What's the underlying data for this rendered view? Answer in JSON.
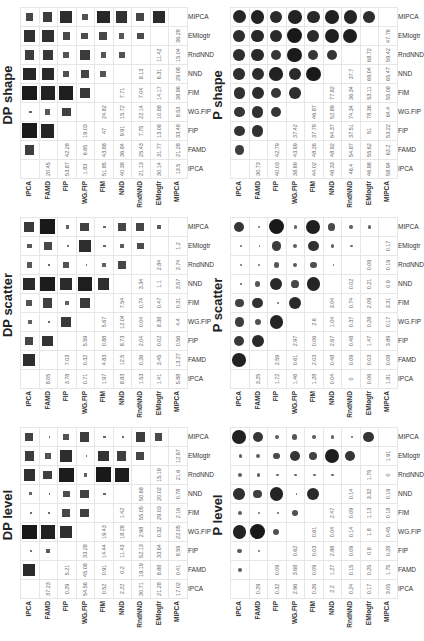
{
  "labels": [
    "IPCA",
    "FAMD",
    "FIP",
    "WG.FIP",
    "FIM",
    "NND",
    "RndNND",
    "EMlogtr",
    "MIPCA"
  ],
  "colors": {
    "marker": "#3c3c3c",
    "grid": "#e6e6e6",
    "text": "#666666"
  },
  "chart_data": [
    {
      "type": "heatmap",
      "title": "DP shape",
      "marker": "square",
      "lower_triangle_values": [
        [],
        [
          20.45
        ],
        [
          53.87,
          42.28
        ],
        [
          1.83,
          6.65,
          19.03
        ],
        [
          51.85,
          43.88,
          47,
          24.82
        ],
        [
          40.38,
          36.84,
          9.91,
          15.72,
          7.71
        ],
        [
          21.13,
          25.43,
          7.75,
          22.14,
          7.04,
          8.13
        ],
        [
          30.14,
          31.77,
          13.08,
          10.88,
          14.17,
          6.31,
          11.42
        ],
        [
          13.5,
          21.28,
          33.48,
          8.53,
          38.96,
          29.08,
          15.04,
          36.29
        ]
      ]
    },
    {
      "type": "heatmap",
      "title": "DP scatter",
      "marker": "square",
      "lower_triangle_values": [
        [],
        [
          8.05
        ],
        [
          3.78,
          7.03
        ],
        [
          0.71,
          0.32,
          5.59
        ],
        [
          1.97,
          4.83,
          0.88,
          5.67
        ],
        [
          8.83,
          12.5,
          8.73,
          12.04,
          7.54
        ],
        [
          1.53,
          0.26,
          2.04,
          0.04,
          0.74,
          3.34
        ],
        [
          1.41,
          3.45,
          0.02,
          8.38,
          0.47,
          1.1,
          2.84
        ],
        [
          5.88,
          13.27,
          0.56,
          4.4,
          0.31,
          3.57,
          3.74,
          1.2
        ]
      ]
    },
    {
      "type": "heatmap",
      "title": "DP level",
      "marker": "square",
      "lower_triangle_values": [
        [],
        [
          37.23
        ],
        [
          0.29,
          5.21
        ],
        [
          54.56,
          45.08,
          33.28
        ],
        [
          0.52,
          0.91,
          14.44,
          19.43
        ],
        [
          2.22,
          0.2,
          11.43,
          18.28,
          1.42
        ],
        [
          30.71,
          19.19,
          52.13,
          2.98,
          55.05,
          50.68
        ],
        [
          21.28,
          8.88,
          33.64,
          0.32,
          29.03,
          20.02,
          15.19
        ],
        [
          17.02,
          0.41,
          8.59,
          22.05,
          2.16,
          0.78,
          21.6,
          12.67
        ]
      ]
    },
    {
      "type": "heatmap",
      "title": "P shape",
      "marker": "circle",
      "lower_triangle_values": [
        [],
        [
          30.73
        ],
        [
          40.03,
          42.79
        ],
        [
          38.69,
          43.69,
          37.42
        ],
        [
          44.02,
          48.26,
          37.79,
          46.87
        ],
        [
          46.33,
          48.92,
          64.37,
          52.89,
          77.82
        ],
        [
          46.4,
          54.87,
          37.51,
          74.34,
          36.34,
          37.7
        ],
        [
          46.98,
          55.62,
          51,
          78.36,
          53.11,
          69.04,
          68.72
        ],
        [
          58.94,
          63.2,
          53.22,
          64.4,
          55.08,
          65.47,
          59.42,
          47.76
        ]
      ]
    },
    {
      "type": "heatmap",
      "title": "P scatter",
      "marker": "circle",
      "lower_triangle_values": [
        [],
        [
          3.25
        ],
        [
          1.72,
          2.59
        ],
        [
          1.46,
          0.61,
          2.97
        ],
        [
          1.28,
          2.03,
          0.06,
          2.6
        ],
        [
          0.04,
          0.48,
          2.67,
          1.04,
          3.04
        ],
        [
          0,
          0.09,
          0.48,
          0.37,
          0.74,
          0.02
        ],
        [
          0.06,
          0.03,
          1.47,
          0.28,
          2.09,
          0.21,
          0.09
        ],
        [
          1.81,
          0.09,
          3.89,
          0.17,
          3.31,
          0.9,
          0.19,
          0.17
        ]
      ]
    },
    {
      "type": "heatmap",
      "title": "P level",
      "marker": "circle",
      "lower_triangle_values": [
        [],
        [
          0.29
        ],
        [
          0.32,
          0.09
        ],
        [
          2.96,
          3.68,
          0.62
        ],
        [
          0.26,
          0.09,
          0.03,
          0.61
        ],
        [
          2.2,
          1.27,
          2.88,
          0.04,
          2.47
        ],
        [
          0.24,
          0.15,
          0.09,
          0.14,
          0.09,
          0.14
        ],
        [
          0.17,
          0.25,
          0.8,
          1.8,
          1.13,
          3.32,
          1.75
        ],
        [
          3.05,
          1.75,
          0.28,
          0.45,
          0.18,
          0.19,
          0,
          1.91
        ]
      ]
    }
  ]
}
